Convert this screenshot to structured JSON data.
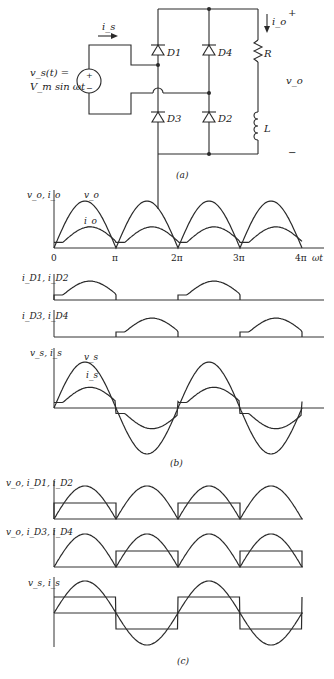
{
  "circuit": {
    "caption": "(a)",
    "source_label_line1": "v_s(t) =",
    "source_label_line2": "V_m sin ωt",
    "source_plus": "+",
    "source_minus": "−",
    "current_is": "i_s",
    "current_io": "i_o",
    "diodes": [
      "D1",
      "D4",
      "D3",
      "D2"
    ],
    "resistor": "R",
    "inductor": "L",
    "output_voltage": "v_o",
    "output_plus": "+",
    "output_minus": "−"
  },
  "panel_b": {
    "caption": "(b)",
    "x_ticks": [
      "0",
      "π",
      "2π",
      "3π",
      "4π"
    ],
    "x_label": "ωt"
  },
  "panel_c": {
    "caption": "(c)"
  },
  "chart_data": [
    {
      "type": "line",
      "panel": "b1",
      "ylabel": "v_o, i_o",
      "xlabel": "ωt",
      "x_ticks": [
        "0",
        "π",
        "2π",
        "3π",
        "4π"
      ],
      "xlim": [
        0,
        "4π"
      ],
      "series": [
        {
          "name": "v_o",
          "description": "full-wave rectified sine |Vm sin ωt|, peak 1.0 (normalized)"
        },
        {
          "name": "i_o",
          "description": "rectified current with RL lag, peak ≈0.45, minimum ≈0.1 (continuous)"
        }
      ]
    },
    {
      "type": "line",
      "panel": "b2",
      "ylabel": "i_D1, i_D2",
      "series": [
        {
          "name": "i_D1,i_D2",
          "description": "conducts on 0–π and 2π–3π, shape follows i_o"
        }
      ]
    },
    {
      "type": "line",
      "panel": "b3",
      "ylabel": "i_D3, i_D4",
      "series": [
        {
          "name": "i_D3,i_D4",
          "description": "conducts on π–2π and 3π–4π, shape follows i_o"
        }
      ]
    },
    {
      "type": "line",
      "panel": "b4",
      "ylabel": "v_s, i_s",
      "series": [
        {
          "name": "v_s",
          "description": "sine Vm sin ωt, amplitude 1.0"
        },
        {
          "name": "i_s",
          "description": "alternating i_o with sign of v_s, amplitude ≈0.45"
        }
      ]
    },
    {
      "type": "line",
      "panel": "c1",
      "ylabel": "v_o, i_D1, i_D2",
      "series": [
        {
          "name": "v_o",
          "description": "full-wave rectified sine"
        },
        {
          "name": "i_D1,i_D2",
          "description": "square pulses, level ≈0.5, on 0–π and 2π–3π"
        }
      ]
    },
    {
      "type": "line",
      "panel": "c2",
      "ylabel": "v_o, i_D3, i_D4",
      "series": [
        {
          "name": "v_o",
          "description": "full-wave rectified sine"
        },
        {
          "name": "i_D3,i_D4",
          "description": "square pulses, level ≈0.5, on π–2π and 3π–4π"
        }
      ]
    },
    {
      "type": "line",
      "panel": "c3",
      "ylabel": "v_s, i_s",
      "series": [
        {
          "name": "v_s",
          "description": "sine"
        },
        {
          "name": "i_s",
          "description": "square wave ±0.5 in phase with v_s"
        }
      ]
    }
  ],
  "labels": {
    "b1_y": "v_o, i_o",
    "b1_vo": "v_o",
    "b1_io": "i_o",
    "b2_y": "i_D1, i_D2",
    "b3_y": "i_D3, i_D4",
    "b4_y": "v_s, i_s",
    "b4_vs": "v_s",
    "b4_is": "i_s",
    "c1_y": "v_o, i_D1, i_D2",
    "c2_y": "v_o, i_D3, i_D4",
    "c3_y": "v_s, i_s"
  }
}
